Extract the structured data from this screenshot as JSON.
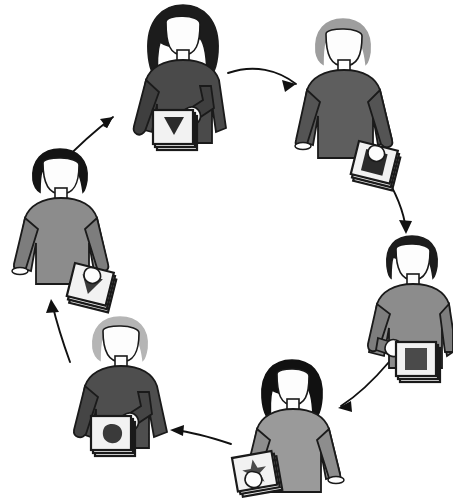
{
  "diagram": {
    "type": "cycle-diagram",
    "background_color": "#ffffff",
    "outline_color": "#1a1a1a",
    "arrow_color": "#111111",
    "paper_color": "#f2f2f2",
    "skin_color": "#fdfdfd",
    "node_count": 6,
    "arrow_count": 6,
    "direction": "clockwise",
    "nodes": [
      {
        "id": "person-top",
        "position": "top",
        "label": "person-top",
        "hair_style": "long-wavy",
        "hair_color": "#1c1c1c",
        "sweater_color": "#4a4a4a",
        "sleeve_color": "#3f3f3f",
        "holds": "document-stack",
        "document_mark": "triangle-down",
        "document_mark_color": "#2b2b2b",
        "hand_side": "right"
      },
      {
        "id": "person-top-right",
        "position": "top-right",
        "label": "person-top-right",
        "hair_style": "short-swept",
        "hair_color": "#9e9e9e",
        "sweater_color": "#5e5e5e",
        "sleeve_color": "#545454",
        "holds": "document-stack",
        "document_mark": "square",
        "document_mark_color": "#2b2b2b",
        "hand_side": "right"
      },
      {
        "id": "person-right",
        "position": "right",
        "label": "person-right",
        "hair_style": "short-dark",
        "hair_color": "#1c1c1c",
        "sweater_color": "#8c8c8c",
        "sleeve_color": "#7d7d7d",
        "holds": "document-stack",
        "document_mark": "square",
        "document_mark_color": "#4a4a4a",
        "hand_side": "left"
      },
      {
        "id": "person-bottom",
        "position": "bottom",
        "label": "person-bottom",
        "hair_style": "long-straight",
        "hair_color": "#111111",
        "sweater_color": "#9a9a9a",
        "sleeve_color": "#8d8d8d",
        "holds": "document-stack",
        "document_mark": "star",
        "document_mark_color": "#4a4a4a",
        "hand_side": "left"
      },
      {
        "id": "person-bottom-left",
        "position": "bottom-left",
        "label": "person-bottom-left",
        "hair_style": "short-light",
        "hair_color": "#b5b5b5",
        "sweater_color": "#4e4e4e",
        "sleeve_color": "#454545",
        "holds": "document-stack",
        "document_mark": "blob",
        "document_mark_color": "#3a3a3a",
        "hand_side": "right"
      },
      {
        "id": "person-left",
        "position": "left",
        "label": "person-left",
        "hair_style": "short-dark",
        "hair_color": "#141414",
        "sweater_color": "#8c8c8c",
        "sleeve_color": "#7d7d7d",
        "holds": "document-stack",
        "document_mark": "triangle-down",
        "document_mark_color": "#3a3a3a",
        "hand_side": "right"
      }
    ],
    "arrows": [
      {
        "id": "arrow-top-to-top-right",
        "from": "person-top",
        "to": "person-top-right",
        "shape": "curved-right"
      },
      {
        "id": "arrow-top-right-to-right",
        "from": "person-top-right",
        "to": "person-right",
        "shape": "curved-down"
      },
      {
        "id": "arrow-right-to-bottom",
        "from": "person-right",
        "to": "person-bottom",
        "shape": "curved-down-left"
      },
      {
        "id": "arrow-bottom-to-bottom-left",
        "from": "person-bottom",
        "to": "person-bottom-left",
        "shape": "curved-left"
      },
      {
        "id": "arrow-bottom-left-to-left",
        "from": "person-bottom-left",
        "to": "person-left",
        "shape": "curved-up"
      },
      {
        "id": "arrow-left-to-top",
        "from": "person-left",
        "to": "person-top",
        "shape": "curved-up-right"
      }
    ]
  }
}
